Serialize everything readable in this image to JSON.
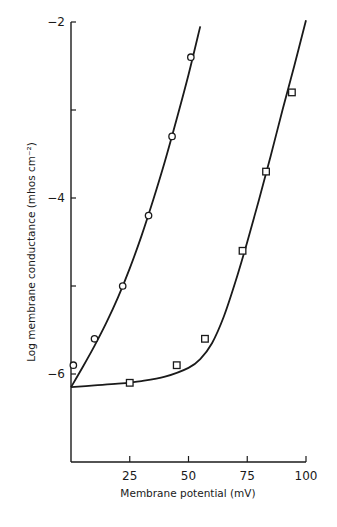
{
  "chart_data": {
    "type": "line",
    "title": "",
    "xlabel": "Membrane potential (mV)",
    "ylabel": "Log membrane conductance (mhos cm⁻²)",
    "xlim": [
      0,
      100
    ],
    "ylim": [
      -7,
      -2
    ],
    "x_ticks": [
      25,
      50,
      75,
      100
    ],
    "x_tick_labels": [
      "25",
      "50",
      "75",
      "100"
    ],
    "y_ticks": [
      -2,
      -3,
      -4,
      -5,
      -6
    ],
    "y_tick_labels": [
      "-2",
      "",
      "-4",
      "",
      "-6"
    ],
    "grid": false,
    "legend": null,
    "series": [
      {
        "name": "circles",
        "marker": "circle",
        "points": [
          {
            "x": 1,
            "y": -5.9
          },
          {
            "x": 10,
            "y": -5.6
          },
          {
            "x": 22,
            "y": -5.0
          },
          {
            "x": 33,
            "y": -4.2
          },
          {
            "x": 43,
            "y": -3.3
          },
          {
            "x": 51,
            "y": -2.4
          }
        ],
        "fit_curve": [
          {
            "x": 0,
            "y": -6.15
          },
          {
            "x": 5,
            "y": -5.92
          },
          {
            "x": 10,
            "y": -5.68
          },
          {
            "x": 15,
            "y": -5.42
          },
          {
            "x": 20,
            "y": -5.13
          },
          {
            "x": 25,
            "y": -4.8
          },
          {
            "x": 30,
            "y": -4.43
          },
          {
            "x": 35,
            "y": -4.02
          },
          {
            "x": 40,
            "y": -3.58
          },
          {
            "x": 45,
            "y": -3.1
          },
          {
            "x": 50,
            "y": -2.6
          },
          {
            "x": 55,
            "y": -2.05
          }
        ]
      },
      {
        "name": "squares",
        "marker": "square",
        "points": [
          {
            "x": 25,
            "y": -6.1
          },
          {
            "x": 45,
            "y": -5.9
          },
          {
            "x": 57,
            "y": -5.6
          },
          {
            "x": 73,
            "y": -4.6
          },
          {
            "x": 83,
            "y": -3.7
          },
          {
            "x": 94,
            "y": -2.8
          }
        ],
        "fit_curve": [
          {
            "x": 0,
            "y": -6.15
          },
          {
            "x": 10,
            "y": -6.13
          },
          {
            "x": 20,
            "y": -6.11
          },
          {
            "x": 30,
            "y": -6.08
          },
          {
            "x": 40,
            "y": -6.03
          },
          {
            "x": 50,
            "y": -5.93
          },
          {
            "x": 55,
            "y": -5.83
          },
          {
            "x": 60,
            "y": -5.65
          },
          {
            "x": 65,
            "y": -5.35
          },
          {
            "x": 70,
            "y": -4.95
          },
          {
            "x": 75,
            "y": -4.5
          },
          {
            "x": 80,
            "y": -4.02
          },
          {
            "x": 85,
            "y": -3.52
          },
          {
            "x": 90,
            "y": -3.0
          },
          {
            "x": 95,
            "y": -2.5
          },
          {
            "x": 100,
            "y": -1.98
          }
        ]
      }
    ]
  }
}
